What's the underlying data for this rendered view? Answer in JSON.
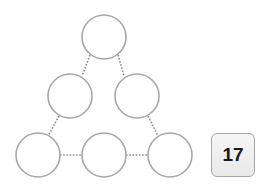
{
  "puzzle": {
    "type": "triangle-sum",
    "target_sum": "17",
    "nodes": [
      {
        "id": "top",
        "value": ""
      },
      {
        "id": "middle-left",
        "value": ""
      },
      {
        "id": "middle-right",
        "value": ""
      },
      {
        "id": "bottom-left",
        "value": ""
      },
      {
        "id": "bottom-middle",
        "value": ""
      },
      {
        "id": "bottom-right",
        "value": ""
      }
    ]
  },
  "colors": {
    "circle_stroke": "#a8a8a8",
    "edge": "#8a8a8a",
    "box_fill": "#efefef",
    "box_border": "#a6a6a6",
    "text": "#1a1a1a"
  }
}
